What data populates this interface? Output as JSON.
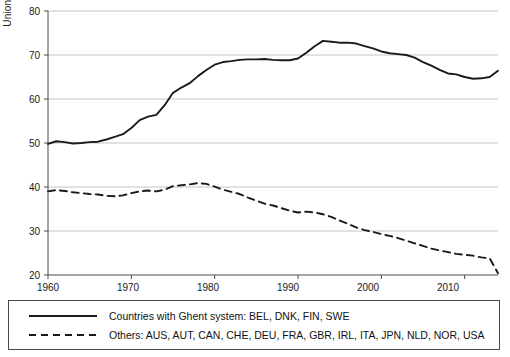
{
  "chart_data": {
    "type": "line",
    "title": "",
    "xlabel": "",
    "ylabel": "Union density (in %)",
    "xlim": [
      1960,
      2014
    ],
    "ylim": [
      20,
      80
    ],
    "xticks": [
      1960,
      1970,
      1980,
      1990,
      2000,
      2010
    ],
    "yticks": [
      20,
      30,
      40,
      50,
      60,
      70,
      80
    ],
    "grid": "horizontal",
    "legend_position": "below-axes",
    "series": [
      {
        "name": "Countries with Ghent system: BEL, DNK, FIN, SWE",
        "style": "solid",
        "color": "#1a1a1a",
        "x": [
          1960,
          1961,
          1962,
          1963,
          1964,
          1965,
          1966,
          1967,
          1968,
          1969,
          1970,
          1971,
          1972,
          1973,
          1974,
          1975,
          1976,
          1977,
          1978,
          1979,
          1980,
          1981,
          1982,
          1983,
          1984,
          1985,
          1986,
          1987,
          1988,
          1989,
          1990,
          1991,
          1992,
          1993,
          1994,
          1995,
          1996,
          1997,
          1998,
          1999,
          2000,
          2001,
          2002,
          2003,
          2004,
          2005,
          2006,
          2007,
          2008,
          2009,
          2010,
          2011,
          2012,
          2013,
          2014
        ],
        "y": [
          49.8,
          50.4,
          50.2,
          49.9,
          50.0,
          50.2,
          50.3,
          50.8,
          51.4,
          52.0,
          53.4,
          55.2,
          56.0,
          56.4,
          58.6,
          61.4,
          62.6,
          63.6,
          65.2,
          66.6,
          67.8,
          68.4,
          68.6,
          68.9,
          69.0,
          69.0,
          69.1,
          68.9,
          68.8,
          68.8,
          69.2,
          70.5,
          72.0,
          73.2,
          73.0,
          72.8,
          72.8,
          72.6,
          72.0,
          71.5,
          70.8,
          70.4,
          70.2,
          70.0,
          69.4,
          68.4,
          67.6,
          66.6,
          65.8,
          65.6,
          65.0,
          64.6,
          64.7,
          65.0,
          66.4
        ]
      },
      {
        "name": "Others: AUS, AUT, CAN, CHE, DEU, FRA, GBR, IRL, ITA, JPN, NLD, NOR, USA",
        "style": "dashed",
        "color": "#1a1a1a",
        "x": [
          1960,
          1961,
          1962,
          1963,
          1964,
          1965,
          1966,
          1967,
          1968,
          1969,
          1970,
          1971,
          1972,
          1973,
          1974,
          1975,
          1976,
          1977,
          1978,
          1979,
          1980,
          1981,
          1982,
          1983,
          1984,
          1985,
          1986,
          1987,
          1988,
          1989,
          1990,
          1991,
          1992,
          1993,
          1994,
          1995,
          1996,
          1997,
          1998,
          1999,
          2000,
          2001,
          2002,
          2003,
          2004,
          2005,
          2006,
          2007,
          2008,
          2009,
          2010,
          2011,
          2012,
          2013,
          2014
        ],
        "y": [
          39.0,
          39.3,
          39.1,
          38.8,
          38.6,
          38.4,
          38.3,
          38.0,
          37.9,
          38.1,
          38.6,
          39.0,
          39.2,
          39.0,
          39.4,
          40.2,
          40.4,
          40.6,
          40.9,
          40.7,
          40.1,
          39.4,
          38.9,
          38.4,
          37.6,
          36.9,
          36.2,
          35.8,
          35.2,
          34.6,
          34.2,
          34.4,
          34.2,
          33.8,
          33.2,
          32.4,
          31.6,
          30.8,
          30.2,
          29.8,
          29.3,
          28.9,
          28.4,
          27.8,
          27.2,
          26.6,
          26.0,
          25.6,
          25.2,
          24.8,
          24.6,
          24.4,
          24.0,
          23.8,
          20.4
        ]
      }
    ]
  },
  "legend": {
    "items": [
      {
        "label": "Countries with Ghent system: BEL, DNK, FIN, SWE",
        "style": "solid"
      },
      {
        "label": "Others: AUS, AUT, CAN, CHE, DEU, FRA, GBR, IRL, ITA, JPN, NLD, NOR, USA",
        "style": "dashed"
      }
    ]
  },
  "axis": {
    "ylabel": "Union density (in %)",
    "yticks": [
      "20",
      "30",
      "40",
      "50",
      "60",
      "70",
      "80"
    ],
    "xticks": [
      "1960",
      "1970",
      "1980",
      "1990",
      "2000",
      "2010"
    ]
  }
}
